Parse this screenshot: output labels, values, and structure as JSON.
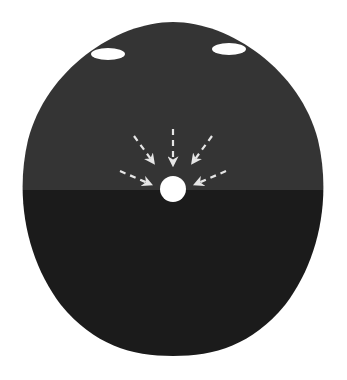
{
  "diagram": {
    "type": "cross-section",
    "colors": {
      "background": "#ffffff",
      "upper_region": "#343434",
      "lower_region": "#1b1b1b",
      "sphere": "#ffffff",
      "arrows": "#e6e6e6",
      "top_marks": "#ffffff"
    },
    "regions": [
      {
        "name": "upper-region",
        "tone": "dark gray"
      },
      {
        "name": "lower-region",
        "tone": "near black"
      }
    ],
    "elements": {
      "central_sphere": {
        "cx": 173,
        "cy": 189,
        "r": 13
      },
      "top_marks": [
        {
          "cx": 108,
          "cy": 54,
          "rx": 17,
          "ry": 6
        },
        {
          "cx": 229,
          "cy": 49,
          "rx": 17,
          "ry": 6
        }
      ],
      "arrows": [
        {
          "x1": 134,
          "y1": 136,
          "x2": 153,
          "y2": 162
        },
        {
          "x1": 173,
          "y1": 129,
          "x2": 173,
          "y2": 164
        },
        {
          "x1": 212,
          "y1": 136,
          "x2": 193,
          "y2": 162
        },
        {
          "x1": 120,
          "y1": 171,
          "x2": 150,
          "y2": 184
        },
        {
          "x1": 226,
          "y1": 171,
          "x2": 196,
          "y2": 184
        }
      ],
      "arrow_count": 5
    }
  }
}
